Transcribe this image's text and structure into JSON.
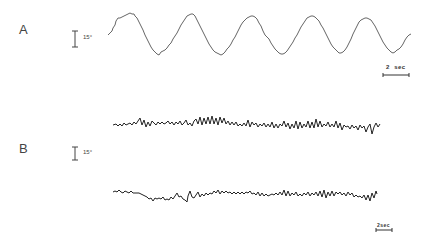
{
  "figure": {
    "panels": [
      {
        "label": "A",
        "amplitude_scale": "15°",
        "time_scale": "2  sec",
        "traces": [
          {
            "name": "sinusoidal tracking trace",
            "cycles": 5,
            "description": "smooth sinusoid with small step-like irregularities"
          }
        ]
      },
      {
        "label": "B",
        "amplitude_scale": "15°",
        "time_scale": "2sec",
        "traces": [
          {
            "name": "irregular trace upper",
            "description": "low-amplitude noisy sawtooth oscillations"
          },
          {
            "name": "irregular trace lower",
            "description": "low-amplitude noisy sawtooth oscillations"
          }
        ]
      }
    ]
  },
  "colors": {
    "trace_a": "#666666",
    "trace_b": "#222222",
    "background": "#ffffff"
  }
}
